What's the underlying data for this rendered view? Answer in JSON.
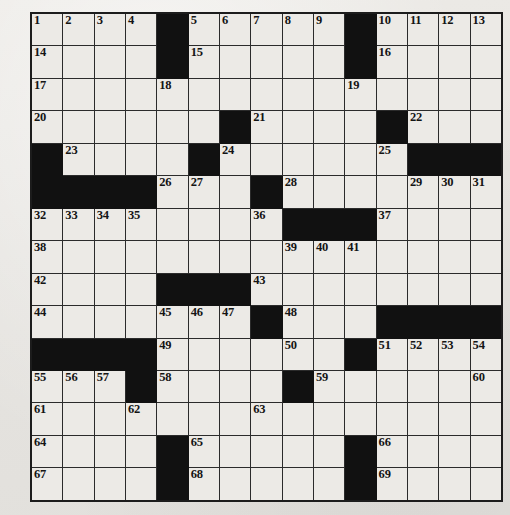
{
  "puzzle": {
    "type": "crossword-grid",
    "rows": 15,
    "cols": 15,
    "colors": {
      "paper": "#e9e8e4",
      "cell_fill": "#eceae6",
      "block_fill": "#111111",
      "grid_line": "#2b2b2b",
      "number_text": "#141414"
    },
    "grid": [
      [
        {
          "num": "1",
          "block": false
        },
        {
          "num": "2",
          "block": false
        },
        {
          "num": "3",
          "block": false
        },
        {
          "num": "4",
          "block": false
        },
        {
          "num": "",
          "block": true
        },
        {
          "num": "5",
          "block": false
        },
        {
          "num": "6",
          "block": false
        },
        {
          "num": "7",
          "block": false
        },
        {
          "num": "8",
          "block": false
        },
        {
          "num": "9",
          "block": false
        },
        {
          "num": "",
          "block": true
        },
        {
          "num": "10",
          "block": false
        },
        {
          "num": "11",
          "block": false
        },
        {
          "num": "12",
          "block": false
        },
        {
          "num": "13",
          "block": false
        }
      ],
      [
        {
          "num": "14",
          "block": false
        },
        {
          "num": "",
          "block": false
        },
        {
          "num": "",
          "block": false
        },
        {
          "num": "",
          "block": false
        },
        {
          "num": "",
          "block": true
        },
        {
          "num": "15",
          "block": false
        },
        {
          "num": "",
          "block": false
        },
        {
          "num": "",
          "block": false
        },
        {
          "num": "",
          "block": false
        },
        {
          "num": "",
          "block": false
        },
        {
          "num": "",
          "block": true
        },
        {
          "num": "16",
          "block": false
        },
        {
          "num": "",
          "block": false
        },
        {
          "num": "",
          "block": false
        },
        {
          "num": "",
          "block": false
        }
      ],
      [
        {
          "num": "17",
          "block": false
        },
        {
          "num": "",
          "block": false
        },
        {
          "num": "",
          "block": false
        },
        {
          "num": "",
          "block": false
        },
        {
          "num": "18",
          "block": false
        },
        {
          "num": "",
          "block": false
        },
        {
          "num": "",
          "block": false
        },
        {
          "num": "",
          "block": false
        },
        {
          "num": "",
          "block": false
        },
        {
          "num": "",
          "block": false
        },
        {
          "num": "19",
          "block": false
        },
        {
          "num": "",
          "block": false
        },
        {
          "num": "",
          "block": false
        },
        {
          "num": "",
          "block": false
        },
        {
          "num": "",
          "block": false
        }
      ],
      [
        {
          "num": "20",
          "block": false
        },
        {
          "num": "",
          "block": false
        },
        {
          "num": "",
          "block": false
        },
        {
          "num": "",
          "block": false
        },
        {
          "num": "",
          "block": false
        },
        {
          "num": "",
          "block": false
        },
        {
          "num": "",
          "block": true
        },
        {
          "num": "21",
          "block": false
        },
        {
          "num": "",
          "block": false
        },
        {
          "num": "",
          "block": false
        },
        {
          "num": "",
          "block": false
        },
        {
          "num": "",
          "block": true
        },
        {
          "num": "22",
          "block": false
        },
        {
          "num": "",
          "block": false
        },
        {
          "num": "",
          "block": false
        }
      ],
      [
        {
          "num": "",
          "block": true
        },
        {
          "num": "23",
          "block": false
        },
        {
          "num": "",
          "block": false
        },
        {
          "num": "",
          "block": false
        },
        {
          "num": "",
          "block": false
        },
        {
          "num": "",
          "block": true
        },
        {
          "num": "24",
          "block": false
        },
        {
          "num": "",
          "block": false
        },
        {
          "num": "",
          "block": false
        },
        {
          "num": "",
          "block": false
        },
        {
          "num": "",
          "block": false
        },
        {
          "num": "25",
          "block": false
        },
        {
          "num": "",
          "block": true
        },
        {
          "num": "",
          "block": true
        },
        {
          "num": "",
          "block": true
        }
      ],
      [
        {
          "num": "",
          "block": true
        },
        {
          "num": "",
          "block": true
        },
        {
          "num": "",
          "block": true
        },
        {
          "num": "",
          "block": true
        },
        {
          "num": "26",
          "block": false
        },
        {
          "num": "27",
          "block": false
        },
        {
          "num": "",
          "block": false
        },
        {
          "num": "",
          "block": true
        },
        {
          "num": "28",
          "block": false
        },
        {
          "num": "",
          "block": false
        },
        {
          "num": "",
          "block": false
        },
        {
          "num": "",
          "block": false
        },
        {
          "num": "29",
          "block": false
        },
        {
          "num": "30",
          "block": false
        },
        {
          "num": "31",
          "block": false
        }
      ],
      [
        {
          "num": "32",
          "block": false
        },
        {
          "num": "33",
          "block": false
        },
        {
          "num": "34",
          "block": false
        },
        {
          "num": "35",
          "block": false
        },
        {
          "num": "",
          "block": false
        },
        {
          "num": "",
          "block": false
        },
        {
          "num": "",
          "block": false
        },
        {
          "num": "36",
          "block": false
        },
        {
          "num": "",
          "block": true
        },
        {
          "num": "",
          "block": true
        },
        {
          "num": "",
          "block": true
        },
        {
          "num": "37",
          "block": false
        },
        {
          "num": "",
          "block": false
        },
        {
          "num": "",
          "block": false
        },
        {
          "num": "",
          "block": false
        }
      ],
      [
        {
          "num": "38",
          "block": false
        },
        {
          "num": "",
          "block": false
        },
        {
          "num": "",
          "block": false
        },
        {
          "num": "",
          "block": false
        },
        {
          "num": "",
          "block": false
        },
        {
          "num": "",
          "block": false
        },
        {
          "num": "",
          "block": false
        },
        {
          "num": "",
          "block": false
        },
        {
          "num": "39",
          "block": false
        },
        {
          "num": "40",
          "block": false
        },
        {
          "num": "41",
          "block": false
        },
        {
          "num": "",
          "block": false
        },
        {
          "num": "",
          "block": false
        },
        {
          "num": "",
          "block": false
        },
        {
          "num": "",
          "block": false
        }
      ],
      [
        {
          "num": "42",
          "block": false
        },
        {
          "num": "",
          "block": false
        },
        {
          "num": "",
          "block": false
        },
        {
          "num": "",
          "block": false
        },
        {
          "num": "",
          "block": true
        },
        {
          "num": "",
          "block": true
        },
        {
          "num": "",
          "block": true
        },
        {
          "num": "43",
          "block": false
        },
        {
          "num": "",
          "block": false
        },
        {
          "num": "",
          "block": false
        },
        {
          "num": "",
          "block": false
        },
        {
          "num": "",
          "block": false
        },
        {
          "num": "",
          "block": false
        },
        {
          "num": "",
          "block": false
        },
        {
          "num": "",
          "block": false
        }
      ],
      [
        {
          "num": "44",
          "block": false
        },
        {
          "num": "",
          "block": false
        },
        {
          "num": "",
          "block": false
        },
        {
          "num": "",
          "block": false
        },
        {
          "num": "45",
          "block": false
        },
        {
          "num": "46",
          "block": false
        },
        {
          "num": "47",
          "block": false
        },
        {
          "num": "",
          "block": true
        },
        {
          "num": "48",
          "block": false
        },
        {
          "num": "",
          "block": false
        },
        {
          "num": "",
          "block": false
        },
        {
          "num": "",
          "block": true
        },
        {
          "num": "",
          "block": true
        },
        {
          "num": "",
          "block": true
        },
        {
          "num": "",
          "block": true
        }
      ],
      [
        {
          "num": "",
          "block": true
        },
        {
          "num": "",
          "block": true
        },
        {
          "num": "",
          "block": true
        },
        {
          "num": "",
          "block": true
        },
        {
          "num": "49",
          "block": false
        },
        {
          "num": "",
          "block": false
        },
        {
          "num": "",
          "block": false
        },
        {
          "num": "",
          "block": false
        },
        {
          "num": "50",
          "block": false
        },
        {
          "num": "",
          "block": false
        },
        {
          "num": "",
          "block": true
        },
        {
          "num": "51",
          "block": false
        },
        {
          "num": "52",
          "block": false
        },
        {
          "num": "53",
          "block": false
        },
        {
          "num": "54",
          "block": false
        }
      ],
      [
        {
          "num": "55",
          "block": false
        },
        {
          "num": "56",
          "block": false
        },
        {
          "num": "57",
          "block": false
        },
        {
          "num": "",
          "block": true
        },
        {
          "num": "58",
          "block": false
        },
        {
          "num": "",
          "block": false
        },
        {
          "num": "",
          "block": false
        },
        {
          "num": "",
          "block": false
        },
        {
          "num": "",
          "block": true
        },
        {
          "num": "59",
          "block": false
        },
        {
          "num": "",
          "block": false
        },
        {
          "num": "",
          "block": false
        },
        {
          "num": "",
          "block": false
        },
        {
          "num": "",
          "block": false
        },
        {
          "num": "60",
          "block": false
        }
      ],
      [
        {
          "num": "61",
          "block": false
        },
        {
          "num": "",
          "block": false
        },
        {
          "num": "",
          "block": false
        },
        {
          "num": "62",
          "block": false
        },
        {
          "num": "",
          "block": false
        },
        {
          "num": "",
          "block": false
        },
        {
          "num": "",
          "block": false
        },
        {
          "num": "63",
          "block": false
        },
        {
          "num": "",
          "block": false
        },
        {
          "num": "",
          "block": false
        },
        {
          "num": "",
          "block": false
        },
        {
          "num": "",
          "block": false
        },
        {
          "num": "",
          "block": false
        },
        {
          "num": "",
          "block": false
        },
        {
          "num": "",
          "block": false
        }
      ],
      [
        {
          "num": "64",
          "block": false
        },
        {
          "num": "",
          "block": false
        },
        {
          "num": "",
          "block": false
        },
        {
          "num": "",
          "block": false
        },
        {
          "num": "",
          "block": true
        },
        {
          "num": "65",
          "block": false
        },
        {
          "num": "",
          "block": false
        },
        {
          "num": "",
          "block": false
        },
        {
          "num": "",
          "block": false
        },
        {
          "num": "",
          "block": false
        },
        {
          "num": "",
          "block": true
        },
        {
          "num": "66",
          "block": false
        },
        {
          "num": "",
          "block": false
        },
        {
          "num": "",
          "block": false
        },
        {
          "num": "",
          "block": false
        }
      ],
      [
        {
          "num": "67",
          "block": false
        },
        {
          "num": "",
          "block": false
        },
        {
          "num": "",
          "block": false
        },
        {
          "num": "",
          "block": false
        },
        {
          "num": "",
          "block": true
        },
        {
          "num": "68",
          "block": false
        },
        {
          "num": "",
          "block": false
        },
        {
          "num": "",
          "block": false
        },
        {
          "num": "",
          "block": false
        },
        {
          "num": "",
          "block": false
        },
        {
          "num": "",
          "block": true
        },
        {
          "num": "69",
          "block": false
        },
        {
          "num": "",
          "block": false
        },
        {
          "num": "",
          "block": false
        },
        {
          "num": "",
          "block": false
        }
      ]
    ]
  }
}
